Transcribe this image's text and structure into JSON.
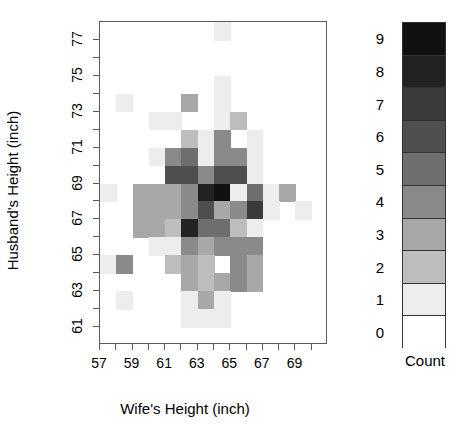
{
  "chart_data": {
    "type": "heatmap",
    "title": "",
    "xlabel": "Wife's Height (inch)",
    "ylabel": "Husband's Height (inch)",
    "xlim": [
      57,
      71
    ],
    "ylim": [
      60,
      78
    ],
    "x_ticks": [
      57,
      58,
      59,
      60,
      61,
      62,
      63,
      64,
      65,
      66,
      67,
      68,
      69,
      70
    ],
    "x_tick_labels": [
      "57",
      "",
      "59",
      "",
      "61",
      "",
      "63",
      "",
      "65",
      "",
      "67",
      "",
      "69",
      ""
    ],
    "y_ticks": [
      61,
      62,
      63,
      64,
      65,
      66,
      67,
      68,
      69,
      70,
      71,
      72,
      73,
      74,
      75,
      76,
      77
    ],
    "y_tick_labels": [
      "61",
      "",
      "63",
      "",
      "65",
      "",
      "67",
      "",
      "69",
      "",
      "71",
      "",
      "73",
      "",
      "75",
      "",
      "77"
    ],
    "grid": false,
    "legend_position": "right",
    "legend_title": "Count",
    "legend_levels": [
      9,
      8,
      7,
      6,
      5,
      4,
      3,
      2,
      1,
      0
    ],
    "legend_colors": [
      "#111111",
      "#222222",
      "#3a3a3a",
      "#4f4f4f",
      "#6e6e6e",
      "#8a8a8a",
      "#a8a8a8",
      "#bdbdbd",
      "#ededed",
      "#ffffff"
    ],
    "color_scale_min": 0,
    "color_scale_max": 9,
    "x_categories": [
      57,
      58,
      59,
      60,
      61,
      62,
      63,
      64,
      65,
      66,
      67,
      68,
      69,
      70
    ],
    "y_categories": [
      61,
      62,
      63,
      64,
      65,
      66,
      67,
      68,
      69,
      70,
      71,
      72,
      73,
      74,
      75,
      76,
      77
    ],
    "cells": [
      {
        "x": 64,
        "y": 77,
        "v": 1
      },
      {
        "x": 64,
        "y": 74,
        "v": 1
      },
      {
        "x": 58,
        "y": 73,
        "v": 1
      },
      {
        "x": 62,
        "y": 73,
        "v": 3
      },
      {
        "x": 64,
        "y": 73,
        "v": 1
      },
      {
        "x": 60,
        "y": 72,
        "v": 1
      },
      {
        "x": 61,
        "y": 72,
        "v": 1
      },
      {
        "x": 64,
        "y": 72,
        "v": 1
      },
      {
        "x": 65,
        "y": 72,
        "v": 2
      },
      {
        "x": 62,
        "y": 71,
        "v": 2
      },
      {
        "x": 63,
        "y": 71,
        "v": 1
      },
      {
        "x": 64,
        "y": 71,
        "v": 4
      },
      {
        "x": 66,
        "y": 71,
        "v": 1
      },
      {
        "x": 60,
        "y": 70,
        "v": 1
      },
      {
        "x": 61,
        "y": 70,
        "v": 4
      },
      {
        "x": 62,
        "y": 70,
        "v": 5
      },
      {
        "x": 63,
        "y": 70,
        "v": 1
      },
      {
        "x": 64,
        "y": 70,
        "v": 4
      },
      {
        "x": 65,
        "y": 70,
        "v": 4
      },
      {
        "x": 66,
        "y": 70,
        "v": 1
      },
      {
        "x": 61,
        "y": 69,
        "v": 6
      },
      {
        "x": 62,
        "y": 69,
        "v": 6
      },
      {
        "x": 63,
        "y": 69,
        "v": 4
      },
      {
        "x": 64,
        "y": 69,
        "v": 6
      },
      {
        "x": 65,
        "y": 69,
        "v": 6
      },
      {
        "x": 66,
        "y": 69,
        "v": 1
      },
      {
        "x": 57,
        "y": 68,
        "v": 1
      },
      {
        "x": 59,
        "y": 68,
        "v": 3
      },
      {
        "x": 60,
        "y": 68,
        "v": 3
      },
      {
        "x": 61,
        "y": 68,
        "v": 3
      },
      {
        "x": 62,
        "y": 68,
        "v": 4
      },
      {
        "x": 63,
        "y": 68,
        "v": 8
      },
      {
        "x": 64,
        "y": 68,
        "v": 9
      },
      {
        "x": 65,
        "y": 68,
        "v": 1
      },
      {
        "x": 66,
        "y": 68,
        "v": 5
      },
      {
        "x": 67,
        "y": 68,
        "v": 1
      },
      {
        "x": 68,
        "y": 68,
        "v": 3
      },
      {
        "x": 59,
        "y": 67,
        "v": 3
      },
      {
        "x": 60,
        "y": 67,
        "v": 3
      },
      {
        "x": 61,
        "y": 67,
        "v": 3
      },
      {
        "x": 62,
        "y": 67,
        "v": 4
      },
      {
        "x": 63,
        "y": 67,
        "v": 6
      },
      {
        "x": 64,
        "y": 67,
        "v": 3
      },
      {
        "x": 65,
        "y": 67,
        "v": 4
      },
      {
        "x": 66,
        "y": 67,
        "v": 7
      },
      {
        "x": 67,
        "y": 67,
        "v": 1
      },
      {
        "x": 69,
        "y": 67,
        "v": 1
      },
      {
        "x": 59,
        "y": 66,
        "v": 3
      },
      {
        "x": 60,
        "y": 66,
        "v": 3
      },
      {
        "x": 61,
        "y": 66,
        "v": 2
      },
      {
        "x": 62,
        "y": 66,
        "v": 8
      },
      {
        "x": 63,
        "y": 66,
        "v": 5
      },
      {
        "x": 64,
        "y": 66,
        "v": 5
      },
      {
        "x": 65,
        "y": 66,
        "v": 2
      },
      {
        "x": 66,
        "y": 66,
        "v": 1
      },
      {
        "x": 60,
        "y": 65,
        "v": 1
      },
      {
        "x": 61,
        "y": 65,
        "v": 1
      },
      {
        "x": 62,
        "y": 65,
        "v": 4
      },
      {
        "x": 63,
        "y": 65,
        "v": 3
      },
      {
        "x": 64,
        "y": 65,
        "v": 4
      },
      {
        "x": 65,
        "y": 65,
        "v": 4
      },
      {
        "x": 66,
        "y": 65,
        "v": 4
      },
      {
        "x": 57,
        "y": 64,
        "v": 1
      },
      {
        "x": 58,
        "y": 64,
        "v": 4
      },
      {
        "x": 61,
        "y": 64,
        "v": 2
      },
      {
        "x": 62,
        "y": 64,
        "v": 3
      },
      {
        "x": 63,
        "y": 64,
        "v": 2
      },
      {
        "x": 64,
        "y": 64,
        "v": 0
      },
      {
        "x": 65,
        "y": 64,
        "v": 4
      },
      {
        "x": 66,
        "y": 64,
        "v": 3
      },
      {
        "x": 62,
        "y": 63,
        "v": 3
      },
      {
        "x": 63,
        "y": 63,
        "v": 2
      },
      {
        "x": 64,
        "y": 63,
        "v": 3
      },
      {
        "x": 65,
        "y": 63,
        "v": 4
      },
      {
        "x": 66,
        "y": 63,
        "v": 3
      },
      {
        "x": 58,
        "y": 62,
        "v": 1
      },
      {
        "x": 62,
        "y": 62,
        "v": 1
      },
      {
        "x": 63,
        "y": 62,
        "v": 3
      },
      {
        "x": 64,
        "y": 62,
        "v": 1
      },
      {
        "x": 62,
        "y": 61,
        "v": 1
      },
      {
        "x": 63,
        "y": 61,
        "v": 1
      },
      {
        "x": 64,
        "y": 61,
        "v": 1
      }
    ]
  }
}
